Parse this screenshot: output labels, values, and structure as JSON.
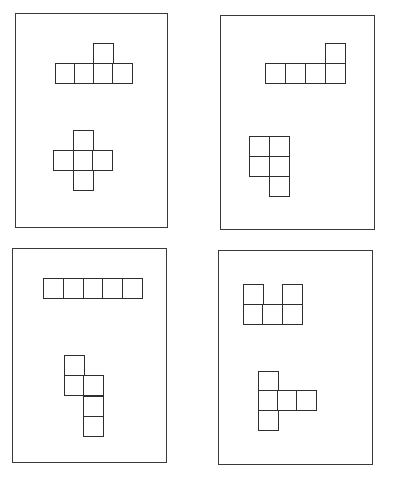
{
  "diagram": {
    "title": "",
    "cell_size": 20,
    "line_color": "#2e2e2e",
    "frame_color": "#3a3a3a",
    "panels": [
      {
        "id": "panel-1",
        "frame": {
          "x": 15,
          "y": 13,
          "w": 153,
          "h": 215
        },
        "shapes": [
          {
            "id": "net-top",
            "cells": [
              [
                55,
                63
              ],
              [
                74,
                63
              ],
              [
                93,
                63
              ],
              [
                112,
                63
              ],
              [
                93,
                43
              ]
            ]
          },
          {
            "id": "net-bottom",
            "cells": [
              [
                73,
                130
              ],
              [
                53,
                150
              ],
              [
                73,
                150
              ],
              [
                92,
                150
              ],
              [
                73,
                170
              ]
            ]
          }
        ]
      },
      {
        "id": "panel-2",
        "frame": {
          "x": 220,
          "y": 15,
          "w": 155,
          "h": 215
        },
        "shapes": [
          {
            "id": "net-top",
            "cells": [
              [
                265,
                63
              ],
              [
                285,
                63
              ],
              [
                305,
                63
              ],
              [
                325,
                63
              ],
              [
                325,
                43
              ]
            ]
          },
          {
            "id": "net-bottom",
            "cells": [
              [
                249,
                136
              ],
              [
                269,
                136
              ],
              [
                249,
                156
              ],
              [
                269,
                156
              ],
              [
                269,
                176
              ]
            ]
          }
        ]
      },
      {
        "id": "panel-3",
        "frame": {
          "x": 12,
          "y": 248,
          "w": 155,
          "h": 215
        },
        "shapes": [
          {
            "id": "net-top",
            "cells": [
              [
                43,
                278
              ],
              [
                63,
                278
              ],
              [
                83,
                278
              ],
              [
                102,
                278
              ],
              [
                122,
                278
              ]
            ]
          },
          {
            "id": "net-bottom",
            "cells": [
              [
                64,
                355
              ],
              [
                64,
                375
              ],
              [
                83,
                375
              ],
              [
                83,
                396
              ],
              [
                83,
                416
              ]
            ]
          }
        ]
      },
      {
        "id": "panel-4",
        "frame": {
          "x": 218,
          "y": 250,
          "w": 155,
          "h": 215
        },
        "shapes": [
          {
            "id": "net-top",
            "cells": [
              [
                243,
                284
              ],
              [
                282,
                284
              ],
              [
                243,
                304
              ],
              [
                262,
                304
              ],
              [
                282,
                304
              ]
            ]
          },
          {
            "id": "net-bottom",
            "cells": [
              [
                258,
                371
              ],
              [
                258,
                390
              ],
              [
                277,
                390
              ],
              [
                296,
                390
              ],
              [
                258,
                410
              ]
            ]
          }
        ]
      }
    ]
  }
}
